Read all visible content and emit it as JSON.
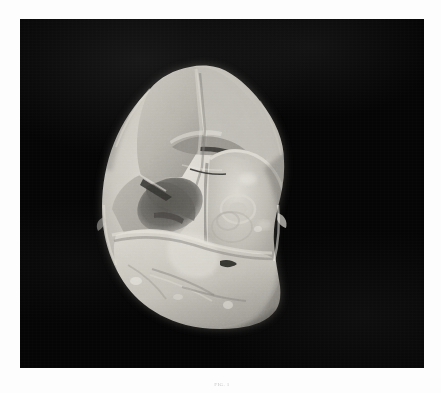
{
  "page": {
    "background_color": "#fdfdfd",
    "plate_background_color": "#050505"
  },
  "plate": {
    "name": "photographic-plate",
    "subject": "flint handaxe biface stone tool",
    "description": "Black and white photograph of a pear-shaped flaked flint handaxe (biface) photographed against a plain black background",
    "orientation": "apex up, butt down",
    "view": "dorsal face",
    "scale_bar_present": "no"
  },
  "artifact": {
    "name": "flint-handaxe",
    "material": "flint",
    "tone_light": "#e3e1da",
    "tone_mid": "#b8b5ae",
    "tone_dark": "#75736e",
    "tone_shadow": "#4a4845",
    "features": [
      {
        "name": "apex-point",
        "label": "pointed tip"
      },
      {
        "name": "ridge-arris",
        "label": "central ridge"
      },
      {
        "name": "large-flake-scar-right",
        "label": "large conchoidal flake scar"
      },
      {
        "name": "bulb-of-percussion",
        "label": "bulb of percussion"
      },
      {
        "name": "dark-flake-scar-left",
        "label": "deep shadowed flake scar"
      },
      {
        "name": "retouched-edge-left",
        "label": "retouched lateral edge"
      },
      {
        "name": "retouched-edge-right",
        "label": "retouched lateral edge"
      },
      {
        "name": "rounded-butt",
        "label": "rounded butt"
      }
    ]
  },
  "caption": {
    "figure_label": "FIG. 1"
  }
}
